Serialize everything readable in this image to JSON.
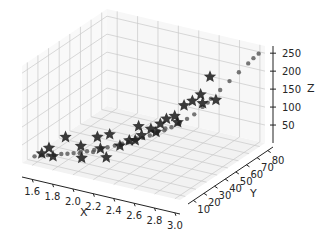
{
  "chart_data": {
    "type": "scatter3d",
    "title": "",
    "xlabel": "X",
    "ylabel": "Y",
    "zlabel": "Z",
    "xlim": [
      1.5,
      3.05
    ],
    "ylim": [
      5,
      85
    ],
    "zlim": [
      0,
      270
    ],
    "grid": true,
    "xticks": [
      "1.6",
      "1.8",
      "2.0",
      "2.2",
      "2.4",
      "2.6",
      "2.8",
      "3.0"
    ],
    "yticks": [
      "10",
      "20",
      "30",
      "40",
      "50",
      "60",
      "70",
      "80"
    ],
    "zticks": [
      "50",
      "100",
      "150",
      "200",
      "250"
    ],
    "series": [
      {
        "name": "circles",
        "marker": "o",
        "color": "#555555",
        "points": [
          [
            1.55,
            12,
            8
          ],
          [
            1.6,
            14,
            10
          ],
          [
            1.65,
            15,
            12
          ],
          [
            1.7,
            16,
            14
          ],
          [
            1.75,
            18,
            16
          ],
          [
            1.8,
            19,
            18
          ],
          [
            1.85,
            20,
            21
          ],
          [
            1.9,
            22,
            24
          ],
          [
            1.95,
            23,
            27
          ],
          [
            2.0,
            25,
            30
          ],
          [
            2.05,
            27,
            34
          ],
          [
            2.1,
            28,
            38
          ],
          [
            2.15,
            30,
            42
          ],
          [
            2.2,
            32,
            47
          ],
          [
            2.25,
            33,
            52
          ],
          [
            2.3,
            35,
            57
          ],
          [
            2.35,
            37,
            63
          ],
          [
            2.4,
            39,
            69
          ],
          [
            2.45,
            41,
            75
          ],
          [
            2.5,
            43,
            82
          ],
          [
            2.55,
            45,
            90
          ],
          [
            2.6,
            47,
            98
          ],
          [
            2.65,
            50,
            110
          ],
          [
            2.7,
            52,
            122
          ],
          [
            2.75,
            55,
            140
          ],
          [
            2.8,
            58,
            160
          ],
          [
            2.85,
            62,
            180
          ],
          [
            2.9,
            66,
            200
          ],
          [
            2.95,
            70,
            220
          ],
          [
            3.0,
            74,
            240
          ],
          [
            3.02,
            77,
            250
          ],
          [
            3.04,
            80,
            258
          ],
          [
            2.0,
            24,
            26
          ],
          [
            2.3,
            36,
            60
          ],
          [
            2.6,
            48,
            100
          ],
          [
            1.9,
            21,
            22
          ],
          [
            2.2,
            31,
            45
          ],
          [
            2.5,
            44,
            85
          ],
          [
            2.45,
            42,
            78
          ],
          [
            2.78,
            57,
            150
          ]
        ]
      },
      {
        "name": "stars",
        "marker": "*",
        "color": "#1a1a1a",
        "points": [
          [
            1.6,
            14,
            15
          ],
          [
            1.65,
            16,
            30
          ],
          [
            1.7,
            15,
            12
          ],
          [
            1.75,
            22,
            55
          ],
          [
            1.9,
            22,
            40
          ],
          [
            1.95,
            18,
            18
          ],
          [
            2.0,
            28,
            60
          ],
          [
            2.05,
            26,
            35
          ],
          [
            2.1,
            30,
            70
          ],
          [
            2.15,
            22,
            25
          ],
          [
            2.2,
            30,
            45
          ],
          [
            2.25,
            34,
            55
          ],
          [
            2.3,
            38,
            90
          ],
          [
            2.35,
            30,
            70
          ],
          [
            2.4,
            40,
            85
          ],
          [
            2.45,
            44,
            95
          ],
          [
            2.5,
            45,
            110
          ],
          [
            2.55,
            48,
            115
          ],
          [
            2.6,
            52,
            140
          ],
          [
            2.6,
            46,
            105
          ],
          [
            2.65,
            55,
            150
          ],
          [
            2.7,
            58,
            165
          ],
          [
            2.75,
            55,
            150
          ],
          [
            2.75,
            62,
            210
          ],
          [
            2.85,
            58,
            160
          ],
          [
            2.45,
            40,
            80
          ],
          [
            2.35,
            36,
            72
          ]
        ]
      }
    ]
  }
}
